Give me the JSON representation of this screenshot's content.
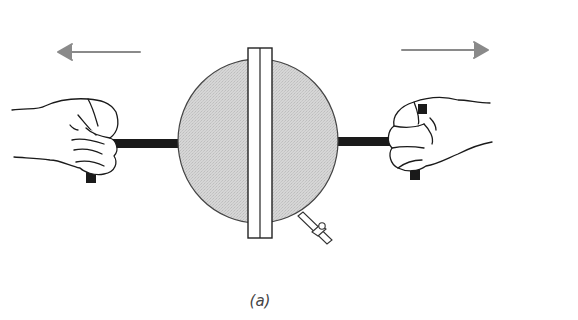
{
  "figure": {
    "label": "(a)",
    "elements": {
      "left_arrow": {
        "direction": "left",
        "color": "#8a8a8a"
      },
      "right_arrow": {
        "direction": "right",
        "color": "#8a8a8a"
      },
      "sphere": {
        "fill": "#d4d4d4",
        "stroke": "#444444"
      },
      "flange": {
        "fill": "#ffffff",
        "stroke": "#222222"
      },
      "rods": {
        "color": "#1a1a1a"
      },
      "hands": {
        "count": 2,
        "pose": "fist-gripping-handle"
      },
      "stopcock": {
        "position": "lower-right"
      }
    }
  }
}
